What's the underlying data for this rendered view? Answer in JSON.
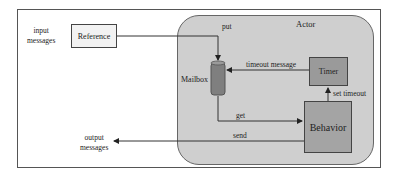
{
  "diagram": {
    "outer_labels": {
      "input": [
        "input",
        "messages"
      ],
      "output": [
        "output",
        "messages"
      ]
    },
    "actor": {
      "title": "Actor"
    },
    "nodes": {
      "reference": "Reference",
      "mailbox": "Mailbox",
      "timer": "Timer",
      "behavior": "Behavior"
    },
    "edges": {
      "put": "put",
      "timeout_message": "timeout message",
      "get": "get",
      "set_timeout": "set timeout",
      "send": "send"
    },
    "colors": {
      "actor_fill": "#cfcfcf",
      "mailbox_fill": "#7f7f7f",
      "timer_fill": "#9a9a9a",
      "behavior_fill": "#a4a4a4",
      "reference_fill": "#f2f2f2"
    }
  }
}
